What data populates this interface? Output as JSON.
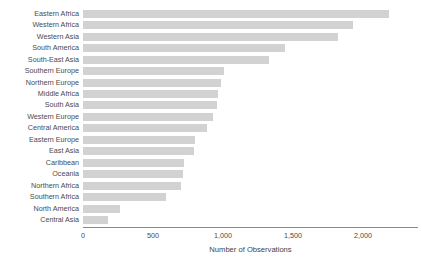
{
  "chart_data": {
    "type": "bar",
    "orientation": "horizontal",
    "title": "",
    "xlabel": "Number of Observations",
    "ylabel": "",
    "xlim": [
      0,
      2200
    ],
    "grid": false,
    "legend": null,
    "bar_color": "#d2d2d2",
    "axis_color": "#8a8a8a",
    "xticks": [
      0,
      500,
      1000,
      1500,
      2000
    ],
    "xtick_labels": [
      "0",
      "500",
      "1,000",
      "1,500",
      "2,000"
    ],
    "categories": [
      "Eastern Africa",
      "Western Africa",
      "Western Asia",
      "South America",
      "South-East Asia",
      "Southern Europe",
      "Northern Europe",
      "Middle Africa",
      "South Asia",
      "Western Europe",
      "Central America",
      "Eastern Europe",
      "East Asia",
      "Caribbean",
      "Oceania",
      "Northern Africa",
      "Southern Africa",
      "North America",
      "Central Asia"
    ],
    "values": [
      2185,
      1925,
      1820,
      1440,
      1325,
      1010,
      985,
      965,
      960,
      930,
      885,
      800,
      790,
      720,
      715,
      700,
      590,
      265,
      180
    ]
  }
}
